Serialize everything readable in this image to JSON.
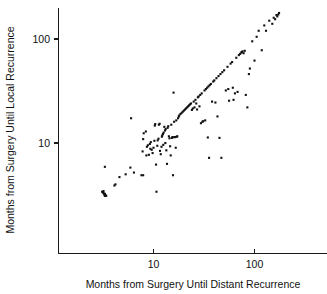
{
  "chart_data": {
    "type": "scatter",
    "title": "",
    "xlabel": "Months from Surgery Until Distant Recurrence",
    "ylabel": "Months from Surgery Until Local Recurrence",
    "xscale": "log",
    "yscale": "log",
    "grid": false,
    "legend": null,
    "xlim": [
      2.0,
      290.0
    ],
    "ylim": [
      2.6,
      215.0
    ],
    "xticks": [
      10,
      100
    ],
    "xticklabels": [
      "10",
      "100"
    ],
    "yticks": [
      10,
      100
    ],
    "yticklabels": [
      "10",
      "100"
    ],
    "marker": "square-dot",
    "marker_color": "#111111",
    "marker_size": 2.1,
    "points": [
      [
        3.25,
        3.2
      ],
      [
        3.3,
        3.25
      ],
      [
        3.2,
        3.3
      ],
      [
        3.35,
        3.15
      ],
      [
        3.15,
        3.35
      ],
      [
        3.4,
        3.1
      ],
      [
        3.1,
        3.4
      ],
      [
        3.3,
        3.1
      ],
      [
        3.2,
        3.45
      ],
      [
        3.3,
        5.9
      ],
      [
        4.1,
        3.9
      ],
      [
        4.2,
        4.0
      ],
      [
        4.6,
        4.7
      ],
      [
        5.3,
        5.0
      ],
      [
        5.9,
        5.8
      ],
      [
        6.4,
        5.2
      ],
      [
        6.0,
        17.3
      ],
      [
        7.6,
        4.9
      ],
      [
        7.9,
        4.9
      ],
      [
        7.8,
        8.3
      ],
      [
        7.9,
        10.9
      ],
      [
        8.0,
        12.4
      ],
      [
        8.4,
        12.9
      ],
      [
        8.6,
        9.2
      ],
      [
        8.8,
        9.5
      ],
      [
        8.5,
        7.6
      ],
      [
        9.0,
        7.7
      ],
      [
        9.2,
        9.8
      ],
      [
        9.4,
        10.2
      ],
      [
        9.6,
        8.6
      ],
      [
        9.3,
        8.8
      ],
      [
        9.8,
        8.0
      ],
      [
        10.0,
        9.0
      ],
      [
        10.2,
        10.5
      ],
      [
        10.3,
        14.7
      ],
      [
        10.4,
        15.2
      ],
      [
        10.6,
        6.2
      ],
      [
        10.7,
        3.4
      ],
      [
        10.9,
        9.4
      ],
      [
        11.0,
        10.6
      ],
      [
        11.2,
        11.0
      ],
      [
        11.3,
        15.0
      ],
      [
        11.5,
        15.3
      ],
      [
        11.6,
        8.4
      ],
      [
        11.8,
        7.8
      ],
      [
        12.0,
        9.2
      ],
      [
        12.1,
        11.5
      ],
      [
        12.2,
        11.8
      ],
      [
        12.4,
        12.2
      ],
      [
        12.6,
        12.6
      ],
      [
        12.5,
        9.6
      ],
      [
        12.8,
        14.3
      ],
      [
        13.0,
        13.2
      ],
      [
        13.2,
        13.6
      ],
      [
        13.1,
        10.0
      ],
      [
        13.4,
        8.5
      ],
      [
        13.6,
        6.3
      ],
      [
        13.8,
        14.0
      ],
      [
        14.0,
        14.5
      ],
      [
        14.2,
        11.6
      ],
      [
        14.4,
        11.1
      ],
      [
        14.6,
        9.3
      ],
      [
        14.8,
        7.6
      ],
      [
        15.0,
        15.0
      ],
      [
        15.2,
        11.2
      ],
      [
        15.4,
        11.3
      ],
      [
        15.5,
        11.4
      ],
      [
        15.6,
        4.9
      ],
      [
        15.8,
        30.5
      ],
      [
        16.0,
        16.0
      ],
      [
        16.2,
        11.4
      ],
      [
        16.4,
        11.4
      ],
      [
        16.6,
        9.0
      ],
      [
        16.8,
        16.5
      ],
      [
        17.0,
        11.5
      ],
      [
        17.2,
        11.6
      ],
      [
        17.5,
        17.3
      ],
      [
        17.8,
        18.0
      ],
      [
        18.0,
        18.4
      ],
      [
        18.5,
        19.0
      ],
      [
        19.0,
        19.5
      ],
      [
        19.5,
        20.0
      ],
      [
        20.0,
        20.5
      ],
      [
        20.5,
        21.0
      ],
      [
        21.0,
        21.5
      ],
      [
        21.5,
        22.0
      ],
      [
        22.0,
        22.5
      ],
      [
        22.5,
        23.0
      ],
      [
        23.0,
        23.5
      ],
      [
        23.5,
        24.0
      ],
      [
        24.0,
        20.8
      ],
      [
        24.5,
        21.5
      ],
      [
        25.0,
        25.0
      ],
      [
        25.5,
        22.0
      ],
      [
        26.0,
        26.0
      ],
      [
        26.5,
        24.0
      ],
      [
        27.0,
        21.0
      ],
      [
        27.5,
        27.5
      ],
      [
        28.0,
        28.0
      ],
      [
        28.5,
        22.5
      ],
      [
        29.0,
        29.0
      ],
      [
        29.5,
        15.5
      ],
      [
        30.0,
        30.0
      ],
      [
        30.5,
        16.0
      ],
      [
        31.0,
        16.2
      ],
      [
        32.0,
        32.0
      ],
      [
        32.5,
        16.5
      ],
      [
        33.0,
        33.0
      ],
      [
        34.0,
        34.0
      ],
      [
        34.5,
        11.3
      ],
      [
        35.0,
        35.0
      ],
      [
        35.5,
        7.2
      ],
      [
        36.0,
        36.0
      ],
      [
        37.0,
        37.0
      ],
      [
        38.0,
        25.0
      ],
      [
        39.0,
        39.0
      ],
      [
        40.0,
        40.0
      ],
      [
        41.0,
        24.5
      ],
      [
        42.0,
        42.0
      ],
      [
        43.0,
        18.0
      ],
      [
        44.0,
        44.0
      ],
      [
        45.0,
        11.2
      ],
      [
        46.0,
        46.0
      ],
      [
        47.0,
        7.2
      ],
      [
        48.0,
        48.0
      ],
      [
        50.0,
        50.0
      ],
      [
        52.0,
        32.0
      ],
      [
        54.0,
        54.0
      ],
      [
        55.0,
        33.0
      ],
      [
        56.0,
        25.5
      ],
      [
        58.0,
        58.0
      ],
      [
        60.0,
        60.0
      ],
      [
        61.0,
        34.0
      ],
      [
        62.0,
        26.0
      ],
      [
        64.0,
        30.0
      ],
      [
        66.0,
        66.0
      ],
      [
        68.0,
        31.0
      ],
      [
        70.0,
        70.0
      ],
      [
        72.0,
        72.0
      ],
      [
        74.0,
        74.0
      ],
      [
        75.0,
        75.0
      ],
      [
        76.0,
        76.0
      ],
      [
        78.0,
        73.0
      ],
      [
        80.0,
        77.0
      ],
      [
        82.0,
        29.0
      ],
      [
        85.0,
        22.0
      ],
      [
        88.0,
        46.0
      ],
      [
        90.0,
        52.0
      ],
      [
        95.0,
        95.0
      ],
      [
        100.0,
        62.0
      ],
      [
        105.0,
        105.0
      ],
      [
        110.0,
        120.0
      ],
      [
        118.0,
        78.0
      ],
      [
        125.0,
        135.0
      ],
      [
        130.0,
        120.0
      ],
      [
        140.0,
        150.0
      ],
      [
        150.0,
        140.0
      ],
      [
        155.0,
        160.0
      ],
      [
        160.0,
        155.0
      ],
      [
        165.0,
        170.0
      ],
      [
        168.0,
        165.0
      ],
      [
        172.0,
        172.0
      ],
      [
        175.0,
        178.0
      ]
    ]
  },
  "axes": {
    "x_axis_name": "x-axis",
    "y_axis_name": "y-axis"
  }
}
